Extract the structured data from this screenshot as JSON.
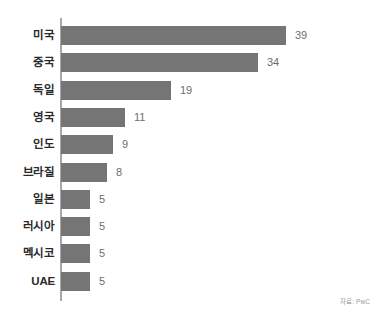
{
  "chart_data": {
    "type": "bar",
    "orientation": "horizontal",
    "title": "",
    "subtitle": "",
    "xlabel": "",
    "ylabel": "",
    "categories": [
      "미국",
      "중국",
      "독일",
      "영국",
      "인도",
      "브라질",
      "일본",
      "러시아",
      "멕시코",
      "UAE"
    ],
    "values": [
      39,
      34,
      19,
      11,
      9,
      8,
      5,
      5,
      5,
      5
    ],
    "value_labels": [
      "39",
      "34",
      "19",
      "11",
      "9",
      "8",
      "5",
      "5",
      "5",
      "5"
    ],
    "xlim": [
      0,
      39
    ],
    "grid": false,
    "legend": null,
    "annotations": [
      "자료: PwC"
    ],
    "bar_color": "#757575",
    "axis_color": "#a8a8a8",
    "label_color": "#2a2a2a",
    "value_color": "#6e6e6e",
    "background_color": "#ffffff"
  },
  "source_note": "자료: PwC"
}
